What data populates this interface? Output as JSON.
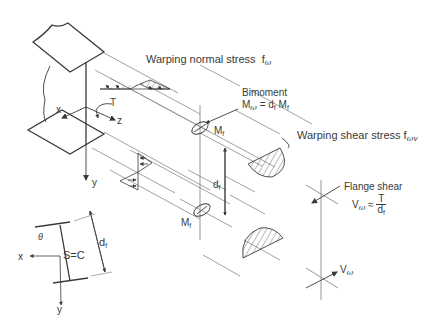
{
  "figure": {
    "type": "structural-mechanics diagram",
    "colors": {
      "stroke": "#3a3a3a",
      "guide": "#8a8a8a",
      "background": "#ffffff"
    }
  },
  "labels": {
    "warping_normal_stress": {
      "text": "Warping normal stress",
      "symbol": "f",
      "sub": "ω"
    },
    "bimoment": {
      "title": "Bimoment",
      "lhs": "M",
      "lhs_sub": "ω",
      "eq": " = d",
      "d_sub": "f",
      "rhs": " M",
      "rhs_sub": "f"
    },
    "mf_top": {
      "text": "M",
      "sub": "f"
    },
    "mf_bottom": {
      "text": "M",
      "sub": "f"
    },
    "df_main": {
      "text": "d",
      "sub": "f"
    },
    "warping_shear_stress": {
      "text": "Warping shear stress",
      "symbol": "f",
      "sub": "ωv"
    },
    "flange_shear": {
      "title": "Flange shear",
      "lhs": "V",
      "lhs_sub": "ω",
      "approx": " ≈ ",
      "num": "T",
      "den": "d",
      "den_sub": "f"
    },
    "v_omega": {
      "text": "V",
      "sub": "ω"
    },
    "axes_3d": {
      "x": "x",
      "y": "y",
      "z": "z",
      "torque": "T"
    },
    "section": {
      "x": "x",
      "y": "y",
      "theta": "θ",
      "sc": "S=C",
      "df": "d",
      "df_sub": "f"
    }
  }
}
